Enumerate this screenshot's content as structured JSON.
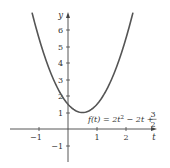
{
  "chart_data": {
    "type": "line",
    "title": "",
    "xlabel": "t",
    "ylabel": "y",
    "xlim": [
      -1.9,
      3.0
    ],
    "ylim": [
      -1.9,
      7.0
    ],
    "grid": false,
    "legend": null,
    "x_ticks": [
      -1,
      1,
      2
    ],
    "x_tick_labels": [
      "−1",
      "1",
      "2"
    ],
    "y_ticks": [
      -1,
      1,
      2,
      3,
      4,
      5,
      6
    ],
    "y_tick_labels": [
      "−1",
      "1",
      "2",
      "3",
      "4",
      "5",
      "6"
    ],
    "series": [
      {
        "name": "f(t) = 2t² − 2t + 3/2",
        "equation": "f(t) = 2t^2 - 2t + 3/2",
        "x": [
          -1.24,
          -1.0,
          -0.75,
          -0.5,
          -0.25,
          0.0,
          0.25,
          0.5,
          0.75,
          1.0,
          1.25,
          1.5,
          1.75,
          2.0,
          2.24
        ],
        "y": [
          7.06,
          5.5,
          4.125,
          3.0,
          2.125,
          1.5,
          1.125,
          1.0,
          1.125,
          1.5,
          2.125,
          3.0,
          4.125,
          5.5,
          7.06
        ]
      }
    ],
    "annotations": [
      {
        "text_parts": [
          "f(t) = 2t",
          "2",
          " − 2t + ",
          "3",
          "2"
        ],
        "anchor_x": 1.05,
        "anchor_y": 0.9
      }
    ],
    "vertex": {
      "t": 0.5,
      "f": 1.0
    },
    "colors": {
      "curve": "#555555",
      "axis": "#444444",
      "text": "#333333"
    }
  },
  "labels": {
    "x_axis": "t",
    "y_axis": "y",
    "function_main": "f(t) = 2t",
    "function_exp": "2",
    "function_rest": " − 2t + ",
    "frac_num": "3",
    "frac_den": "2",
    "ticks": {
      "xm1": "−1",
      "x1": "1",
      "x2": "2",
      "ym1": "−1",
      "y1": "1",
      "y2": "2",
      "y3": "3",
      "y4": "4",
      "y5": "5",
      "y6": "6"
    }
  }
}
